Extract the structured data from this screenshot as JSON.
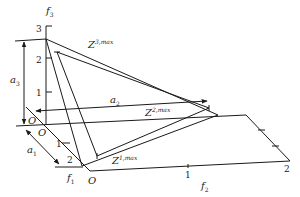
{
  "diagram": {
    "axes": {
      "f1": {
        "label": "f",
        "subscript": "1",
        "ticks": [
          "1",
          "2"
        ]
      },
      "f2": {
        "label": "f",
        "subscript": "2",
        "ticks": [
          "1",
          "2"
        ]
      },
      "f3": {
        "label": "f",
        "subscript": "3",
        "ticks": [
          "1",
          "2",
          "3"
        ]
      }
    },
    "origins": [
      "O",
      "O",
      "O"
    ],
    "arrows": {
      "a1": {
        "label": "a",
        "subscript": "1"
      },
      "a2": {
        "label": "a",
        "subscript": "2"
      },
      "a3": {
        "label": "a",
        "subscript": "3"
      }
    },
    "points": {
      "z1": {
        "label": "Z",
        "superscript": "1,max"
      },
      "z2": {
        "label": "Z",
        "superscript": "2,max"
      },
      "z3": {
        "label": "Z",
        "superscript": "3,max"
      }
    },
    "colors": {
      "stroke": "#1a1a1a",
      "background": "#ffffff"
    }
  }
}
